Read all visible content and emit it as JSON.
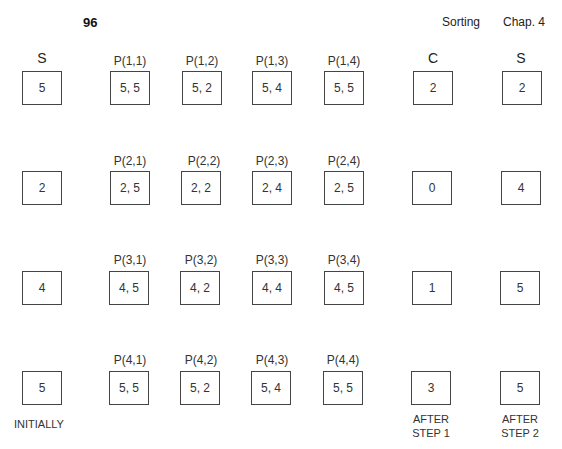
{
  "page": {
    "number": "96",
    "running_head_section": "Sorting",
    "running_head_chapter": "Chap. 4"
  },
  "columns": {
    "s_initial_header": "S",
    "c_header": "C",
    "s_final_header": "S"
  },
  "rows": [
    {
      "s": "5",
      "p": [
        {
          "label": "P(1,1)",
          "value": "5, 5"
        },
        {
          "label": "P(1,2)",
          "value": "5, 2"
        },
        {
          "label": "P(1,3)",
          "value": "5, 4"
        },
        {
          "label": "P(1,4)",
          "value": "5, 5"
        }
      ],
      "c": "2",
      "s_final": "2"
    },
    {
      "s": "2",
      "p": [
        {
          "label": "P(2,1)",
          "value": "2, 5"
        },
        {
          "label": "P(2,2)",
          "value": "2, 2"
        },
        {
          "label": "P(2,3)",
          "value": "2, 4"
        },
        {
          "label": "P(2,4)",
          "value": "2, 5"
        }
      ],
      "c": "0",
      "s_final": "4"
    },
    {
      "s": "4",
      "p": [
        {
          "label": "P(3,1)",
          "value": "4, 5"
        },
        {
          "label": "P(3,2)",
          "value": "4, 2"
        },
        {
          "label": "P(3,3)",
          "value": "4, 4"
        },
        {
          "label": "P(3,4)",
          "value": "4, 5"
        }
      ],
      "c": "1",
      "s_final": "5"
    },
    {
      "s": "5",
      "p": [
        {
          "label": "P(4,1)",
          "value": "5, 5"
        },
        {
          "label": "P(4,2)",
          "value": "5, 2"
        },
        {
          "label": "P(4,3)",
          "value": "5, 4"
        },
        {
          "label": "P(4,4)",
          "value": "5, 5"
        }
      ],
      "c": "3",
      "s_final": "5"
    }
  ],
  "captions": {
    "initially": "INITIALLY",
    "after_step1_line1": "AFTER",
    "after_step1_line2": "STEP 1",
    "after_step2_line1": "AFTER",
    "after_step2_line2": "STEP 2"
  }
}
